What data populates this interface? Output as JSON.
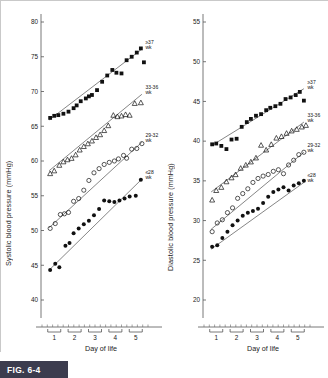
{
  "figure": {
    "label": "FIG. 6-4",
    "caption_badge_color": "#3c3c4e"
  },
  "chart_data": [
    {
      "type": "scatter",
      "panel": "left",
      "title": "",
      "xlabel": "Day of life",
      "ylabel": "Systolic blood pressure (mmHg)",
      "xlim": [
        0.4,
        5.6
      ],
      "ylim": [
        40,
        80
      ],
      "yticks": [
        40,
        45,
        50,
        55,
        60,
        65,
        70,
        75,
        80
      ],
      "xticks": [
        1,
        2,
        3,
        4,
        5
      ],
      "grid": false,
      "legend_position": "right-inline",
      "series": [
        {
          "name": "≥37 wk",
          "marker": "filled-square",
          "trend": [
            [
              0.75,
              65.9
            ],
            [
              5.3,
              76.1
            ]
          ],
          "points": [
            [
              0.8,
              66.2
            ],
            [
              1.0,
              66.5
            ],
            [
              1.2,
              66.6
            ],
            [
              1.45,
              66.8
            ],
            [
              1.7,
              67.1
            ],
            [
              1.95,
              67.6
            ],
            [
              2.1,
              68.0
            ],
            [
              2.3,
              68.6
            ],
            [
              2.55,
              69.0
            ],
            [
              2.7,
              69.3
            ],
            [
              2.85,
              69.5
            ],
            [
              3.1,
              70.2
            ],
            [
              3.35,
              71.4
            ],
            [
              3.6,
              72.3
            ],
            [
              3.85,
              73.1
            ],
            [
              4.05,
              72.7
            ],
            [
              4.3,
              72.6
            ],
            [
              4.55,
              74.5
            ],
            [
              4.8,
              75.0
            ],
            [
              5.05,
              75.6
            ],
            [
              5.25,
              76.2
            ],
            [
              5.4,
              74.2
            ]
          ]
        },
        {
          "name": "33-36 wk",
          "marker": "open-triangle",
          "trend": [
            [
              0.75,
              58.6
            ],
            [
              5.3,
              69.6
            ]
          ],
          "points": [
            [
              0.8,
              58.2
            ],
            [
              1.0,
              58.6
            ],
            [
              1.25,
              59.4
            ],
            [
              1.45,
              59.9
            ],
            [
              1.65,
              60.2
            ],
            [
              1.85,
              60.4
            ],
            [
              2.05,
              60.9
            ],
            [
              2.25,
              61.6
            ],
            [
              2.45,
              62.1
            ],
            [
              2.65,
              62.5
            ],
            [
              2.85,
              62.9
            ],
            [
              3.05,
              63.4
            ],
            [
              3.25,
              63.8
            ],
            [
              3.45,
              64.4
            ],
            [
              3.65,
              65.1
            ],
            [
              3.9,
              66.6
            ],
            [
              4.1,
              66.4
            ],
            [
              4.3,
              66.5
            ],
            [
              4.5,
              66.7
            ],
            [
              4.7,
              66.6
            ],
            [
              4.95,
              68.3
            ],
            [
              5.25,
              68.4
            ]
          ]
        },
        {
          "name": "29-32 wk",
          "marker": "open-circle",
          "trend": [
            [
              0.75,
              50.4
            ],
            [
              5.3,
              62.7
            ]
          ],
          "points": [
            [
              0.8,
              50.3
            ],
            [
              1.05,
              51.0
            ],
            [
              1.3,
              52.3
            ],
            [
              1.5,
              52.4
            ],
            [
              1.7,
              52.6
            ],
            [
              1.95,
              54.2
            ],
            [
              2.2,
              54.6
            ],
            [
              2.45,
              55.8
            ],
            [
              2.7,
              57.2
            ],
            [
              2.95,
              58.3
            ],
            [
              3.2,
              58.9
            ],
            [
              3.45,
              59.5
            ],
            [
              3.7,
              59.8
            ],
            [
              3.95,
              60.0
            ],
            [
              4.15,
              60.3
            ],
            [
              4.4,
              60.8
            ],
            [
              4.55,
              60.4
            ],
            [
              4.8,
              61.7
            ],
            [
              5.05,
              61.8
            ],
            [
              5.3,
              62.5
            ]
          ]
        },
        {
          "name": "≤28 wk",
          "marker": "filled-circle",
          "trend": [
            [
              0.75,
              44.3
            ],
            [
              5.3,
              57.4
            ]
          ],
          "points": [
            [
              0.8,
              44.3
            ],
            [
              1.05,
              45.2
            ],
            [
              1.25,
              44.7
            ],
            [
              1.55,
              47.8
            ],
            [
              1.75,
              48.2
            ],
            [
              1.95,
              49.6
            ],
            [
              2.2,
              50.3
            ],
            [
              2.45,
              50.9
            ],
            [
              2.7,
              51.4
            ],
            [
              2.95,
              52.2
            ],
            [
              3.2,
              53.1
            ],
            [
              3.45,
              54.3
            ],
            [
              3.7,
              54.2
            ],
            [
              3.95,
              54.1
            ],
            [
              4.2,
              54.3
            ],
            [
              4.45,
              54.6
            ],
            [
              4.7,
              54.9
            ],
            [
              5.0,
              55.0
            ],
            [
              5.25,
              57.3
            ]
          ]
        }
      ]
    },
    {
      "type": "scatter",
      "panel": "right",
      "title": "",
      "xlabel": "Day of life",
      "ylabel": "Diastolic blood pressure (mmHg)",
      "xlim": [
        0.4,
        5.6
      ],
      "ylim": [
        20,
        55
      ],
      "yticks": [
        20,
        25,
        30,
        35,
        40,
        45,
        50,
        55
      ],
      "xticks": [
        1,
        2,
        3,
        4,
        5
      ],
      "grid": false,
      "legend_position": "right-inline",
      "series": [
        {
          "name": "≥37 wk",
          "marker": "filled-square",
          "trend": [
            [
              0.75,
              39.4
            ],
            [
              5.3,
              46.6
            ]
          ],
          "points": [
            [
              0.8,
              39.6
            ],
            [
              1.0,
              39.7
            ],
            [
              1.25,
              39.4
            ],
            [
              1.5,
              39.0
            ],
            [
              1.75,
              40.2
            ],
            [
              2.0,
              40.3
            ],
            [
              2.25,
              41.8
            ],
            [
              2.5,
              42.4
            ],
            [
              2.7,
              42.8
            ],
            [
              2.95,
              43.2
            ],
            [
              3.2,
              43.4
            ],
            [
              3.45,
              43.9
            ],
            [
              3.65,
              44.2
            ],
            [
              3.9,
              44.4
            ],
            [
              4.15,
              44.7
            ],
            [
              4.4,
              45.3
            ],
            [
              4.65,
              45.5
            ],
            [
              4.9,
              45.8
            ],
            [
              5.1,
              46.2
            ],
            [
              5.3,
              45.1
            ]
          ]
        },
        {
          "name": "33-36 wk",
          "marker": "open-triangle",
          "trend": [
            [
              0.75,
              33.6
            ],
            [
              5.3,
              42.4
            ]
          ],
          "points": [
            [
              0.8,
              32.6
            ],
            [
              1.0,
              33.8
            ],
            [
              1.25,
              34.2
            ],
            [
              1.5,
              34.9
            ],
            [
              1.75,
              35.4
            ],
            [
              1.95,
              35.8
            ],
            [
              2.2,
              36.6
            ],
            [
              2.45,
              37.0
            ],
            [
              2.7,
              37.4
            ],
            [
              2.95,
              37.9
            ],
            [
              3.2,
              39.5
            ],
            [
              3.45,
              38.9
            ],
            [
              3.7,
              39.6
            ],
            [
              3.95,
              40.4
            ],
            [
              4.2,
              40.6
            ],
            [
              4.45,
              41.0
            ],
            [
              4.7,
              41.3
            ],
            [
              4.95,
              41.5
            ],
            [
              5.2,
              41.8
            ],
            [
              5.4,
              42.0
            ]
          ]
        },
        {
          "name": "29-32 wk",
          "marker": "open-circle",
          "trend": [
            [
              0.75,
              28.9
            ],
            [
              5.3,
              38.6
            ]
          ],
          "points": [
            [
              0.8,
              28.6
            ],
            [
              1.05,
              29.7
            ],
            [
              1.3,
              30.1
            ],
            [
              1.55,
              31.0
            ],
            [
              1.8,
              31.6
            ],
            [
              2.05,
              32.8
            ],
            [
              2.3,
              33.4
            ],
            [
              2.55,
              34.0
            ],
            [
              2.8,
              34.8
            ],
            [
              3.05,
              35.3
            ],
            [
              3.3,
              35.6
            ],
            [
              3.55,
              35.8
            ],
            [
              3.8,
              36.2
            ],
            [
              4.05,
              36.4
            ],
            [
              4.3,
              35.9
            ],
            [
              4.55,
              37.0
            ],
            [
              4.8,
              37.6
            ],
            [
              5.05,
              38.3
            ],
            [
              5.3,
              38.6
            ]
          ]
        },
        {
          "name": "≤28 wk",
          "marker": "filled-circle",
          "trend": [
            [
              0.75,
              26.4
            ],
            [
              5.3,
              34.8
            ]
          ],
          "points": [
            [
              0.8,
              26.7
            ],
            [
              1.05,
              26.9
            ],
            [
              1.3,
              27.8
            ],
            [
              1.55,
              28.6
            ],
            [
              1.8,
              29.4
            ],
            [
              2.05,
              30.0
            ],
            [
              2.3,
              30.6
            ],
            [
              2.55,
              31.0
            ],
            [
              2.8,
              31.2
            ],
            [
              3.05,
              31.5
            ],
            [
              3.3,
              32.2
            ],
            [
              3.55,
              33.0
            ],
            [
              3.8,
              33.6
            ],
            [
              4.05,
              33.9
            ],
            [
              4.3,
              34.2
            ],
            [
              4.55,
              33.8
            ],
            [
              4.8,
              34.4
            ],
            [
              5.05,
              34.7
            ],
            [
              5.3,
              35.0
            ]
          ]
        }
      ]
    }
  ]
}
